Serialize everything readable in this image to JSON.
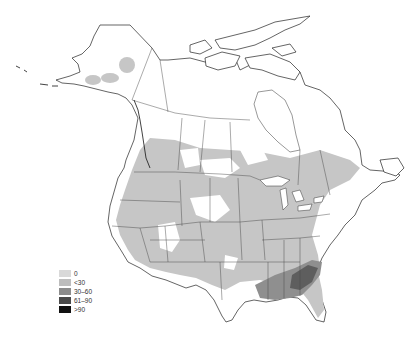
{
  "map": {
    "region": "North America",
    "classification": "choropleth (graduated gray)"
  },
  "legend": {
    "items": [
      {
        "label": "0",
        "color": "#d9d9d9"
      },
      {
        "label": "<30",
        "color": "#bdbdbd"
      },
      {
        "label": "30–60",
        "color": "#8c8c8c"
      },
      {
        "label": "61–90",
        "color": "#4a4a4a"
      },
      {
        "label": ">90",
        "color": "#111111"
      }
    ]
  },
  "colors": {
    "background": "#ffffff",
    "outline": "#222222",
    "shade_light": "#c6c6c6",
    "shade_mid": "#8f8f8f",
    "shade_dark": "#5e5e5e"
  }
}
